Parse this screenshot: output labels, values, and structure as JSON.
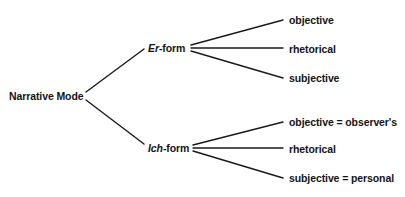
{
  "diagram": {
    "type": "tree",
    "root": {
      "label": "Narrative Mode"
    },
    "branches": [
      {
        "label_italic": "Er",
        "label_rest": "-form",
        "children": [
          {
            "label": "objective"
          },
          {
            "label": "rhetorical"
          },
          {
            "label": "subjective"
          }
        ]
      },
      {
        "label_italic": "Ich",
        "label_rest": "-form",
        "children": [
          {
            "label": "objective = observer's"
          },
          {
            "label": "rhetorical"
          },
          {
            "label": "subjective = personal"
          }
        ]
      }
    ],
    "colors": {
      "line": "#1a1a1a",
      "text": "#141414",
      "background": "#ffffff"
    }
  }
}
